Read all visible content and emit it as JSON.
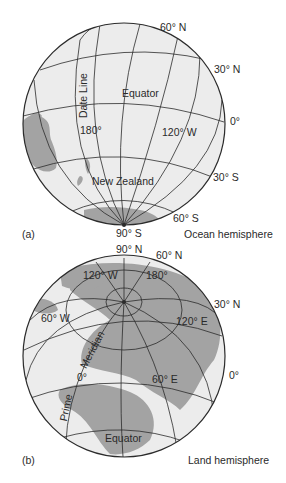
{
  "colors": {
    "ocean": "#ececec",
    "land": "#a3a3a3",
    "grid": "#2b2b2b",
    "text": "#2a2a2a",
    "background": "#ffffff"
  },
  "panel_a": {
    "letter": "(a)",
    "caption": "Ocean hemisphere",
    "labels": {
      "lat_60n": "60° N",
      "lat_30n": "30° N",
      "lat_0": "0°",
      "lat_30s": "30° S",
      "lat_60s": "60° S",
      "lat_90s": "90° S",
      "equator": "Equator",
      "date_line": "Date Line",
      "lon_180": "180°",
      "lon_120w": "120° W",
      "new_zealand": "New Zealand"
    }
  },
  "panel_b": {
    "letter": "(b)",
    "caption": "Land hemisphere",
    "labels": {
      "lat_90n": "90° N",
      "lat_60n": "60° N",
      "lat_30n": "30° N",
      "lat_0": "0°",
      "lon_120w": "120° W",
      "lon_180": "180°",
      "lon_60w": "60° W",
      "lon_120e": "120° E",
      "lon_0": "0°",
      "lon_60e": "60° E",
      "meridian": "Meridian",
      "prime": "Prime",
      "equator": "Equator"
    }
  }
}
